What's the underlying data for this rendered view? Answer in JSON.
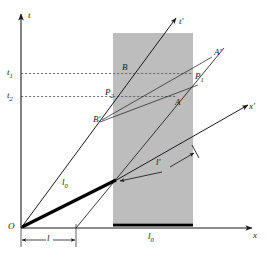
{
  "figure": {
    "background_color": "#ffffff",
    "line_color": "#1a1a1a",
    "rod_color": "#000000",
    "band_color": "#bdbdbd",
    "dash_color": "#555555",
    "width": 267,
    "height": 257
  },
  "axes": {
    "t_label": "t",
    "x_label": "x",
    "t_prime_label": "t'",
    "x_prime_label": "x'",
    "origin_label": "O"
  },
  "tick_labels": {
    "t1": "t",
    "t1_sub": "1",
    "t2": "t",
    "t2_sub": "2"
  },
  "events": [
    {
      "name": "B",
      "label": "B"
    },
    {
      "name": "B-prime",
      "label": "B'"
    },
    {
      "name": "A",
      "label": "A"
    },
    {
      "name": "A-prime",
      "label": "A'"
    },
    {
      "name": "P1",
      "label": "P",
      "sub": "1"
    },
    {
      "name": "P2",
      "label": "P",
      "sub": "2"
    }
  ],
  "measurements": {
    "l_label": "l",
    "l0_diagonal_label": "l",
    "l0_diagonal_sub": "0",
    "l0_baseline_label": "l",
    "l0_baseline_sub": "0",
    "l_prime_label": "l'"
  }
}
